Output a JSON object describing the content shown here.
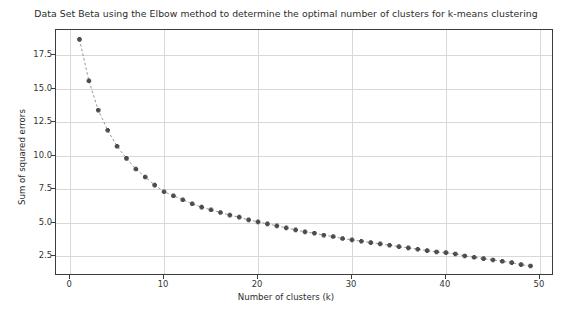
{
  "chart_data": {
    "type": "line",
    "title": "Data Set Beta using the Elbow method to determine the optimal number of clusters for k-means clustering",
    "xlabel": "Number of clusters (k)",
    "ylabel": "Sum of squared errors",
    "grid": true,
    "legend": null,
    "marker": "plus-star",
    "linestyle": "dashed",
    "line_color": "#8c8c8c",
    "marker_color": "#4d4d4d",
    "xlim": [
      -1.5,
      51.5
    ],
    "ylim": [
      1.0,
      19.4
    ],
    "xticks": [
      0,
      10,
      20,
      30,
      40,
      50
    ],
    "xtick_labels": [
      "0",
      "10",
      "20",
      "30",
      "40",
      "50"
    ],
    "yticks": [
      2.5,
      5.0,
      7.5,
      10.0,
      12.5,
      15.0,
      17.5
    ],
    "ytick_labels": [
      "2.5",
      "5.0",
      "7.5",
      "10.0",
      "12.5",
      "15.0",
      "17.5"
    ],
    "x": [
      1,
      2,
      3,
      4,
      5,
      6,
      7,
      8,
      9,
      10,
      11,
      12,
      13,
      14,
      15,
      16,
      17,
      18,
      19,
      20,
      21,
      22,
      23,
      24,
      25,
      26,
      27,
      28,
      29,
      30,
      31,
      32,
      33,
      34,
      35,
      36,
      37,
      38,
      39,
      40,
      41,
      42,
      43,
      44,
      45,
      46,
      47,
      48,
      49
    ],
    "values": [
      18.7,
      15.6,
      13.4,
      11.9,
      10.7,
      9.8,
      9.0,
      8.4,
      7.8,
      7.3,
      7.0,
      6.7,
      6.4,
      6.15,
      5.95,
      5.75,
      5.55,
      5.4,
      5.2,
      5.05,
      4.9,
      4.75,
      4.6,
      4.45,
      4.3,
      4.2,
      4.05,
      3.95,
      3.8,
      3.7,
      3.6,
      3.5,
      3.4,
      3.3,
      3.2,
      3.1,
      3.0,
      2.9,
      2.8,
      2.75,
      2.65,
      2.5,
      2.4,
      2.3,
      2.2,
      2.1,
      2.0,
      1.85,
      1.75
    ]
  }
}
